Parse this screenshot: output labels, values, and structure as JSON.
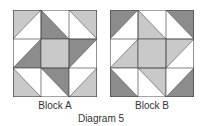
{
  "colors": {
    "light": "#c9c9c9",
    "dark": "#8c8c8c",
    "white": "#ffffff",
    "line": "#4a4a4a"
  },
  "blocks": [
    {
      "label": "Block A",
      "cells": [
        {
          "r": 0,
          "c": 0,
          "fill": "light",
          "corner": "tl"
        },
        {
          "r": 0,
          "c": 1,
          "fill": "dark",
          "corner": "bl"
        },
        {
          "r": 0,
          "c": 2,
          "fill": "light",
          "corner": "tr"
        },
        {
          "r": 1,
          "c": 0,
          "fill": "dark",
          "corner": "br"
        },
        {
          "r": 1,
          "c": 1,
          "fill": "light",
          "corner": "full"
        },
        {
          "r": 1,
          "c": 2,
          "fill": "dark",
          "corner": "tl"
        },
        {
          "r": 2,
          "c": 0,
          "fill": "light",
          "corner": "bl"
        },
        {
          "r": 2,
          "c": 1,
          "fill": "dark",
          "corner": "tr"
        },
        {
          "r": 2,
          "c": 2,
          "fill": "light",
          "corner": "br"
        }
      ]
    },
    {
      "label": "Block B",
      "cells": [
        {
          "r": 0,
          "c": 0,
          "fill": "dark",
          "corner": "tl"
        },
        {
          "r": 0,
          "c": 1,
          "fill": "light",
          "corner": "bl"
        },
        {
          "r": 0,
          "c": 2,
          "fill": "dark",
          "corner": "tr"
        },
        {
          "r": 1,
          "c": 0,
          "fill": "light",
          "corner": "br"
        },
        {
          "r": 1,
          "c": 1,
          "fill": "light",
          "corner": "full"
        },
        {
          "r": 1,
          "c": 2,
          "fill": "light",
          "corner": "tl"
        },
        {
          "r": 2,
          "c": 0,
          "fill": "dark",
          "corner": "bl"
        },
        {
          "r": 2,
          "c": 1,
          "fill": "light",
          "corner": "tr"
        },
        {
          "r": 2,
          "c": 2,
          "fill": "dark",
          "corner": "br"
        }
      ]
    }
  ],
  "caption": "Diagram 5"
}
